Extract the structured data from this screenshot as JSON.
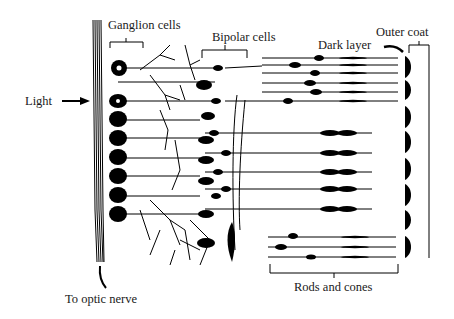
{
  "diagram": {
    "labels": {
      "ganglion": "Ganglion cells",
      "bipolar": "Bipolar cells",
      "dark_layer": "Dark layer",
      "outer_coat": "Outer coat",
      "light": "Light",
      "optic_nerve": "To optic nerve",
      "rods_cones": "Rods and cones"
    },
    "colors": {
      "ink": "#000000",
      "background": "#ffffff"
    }
  }
}
